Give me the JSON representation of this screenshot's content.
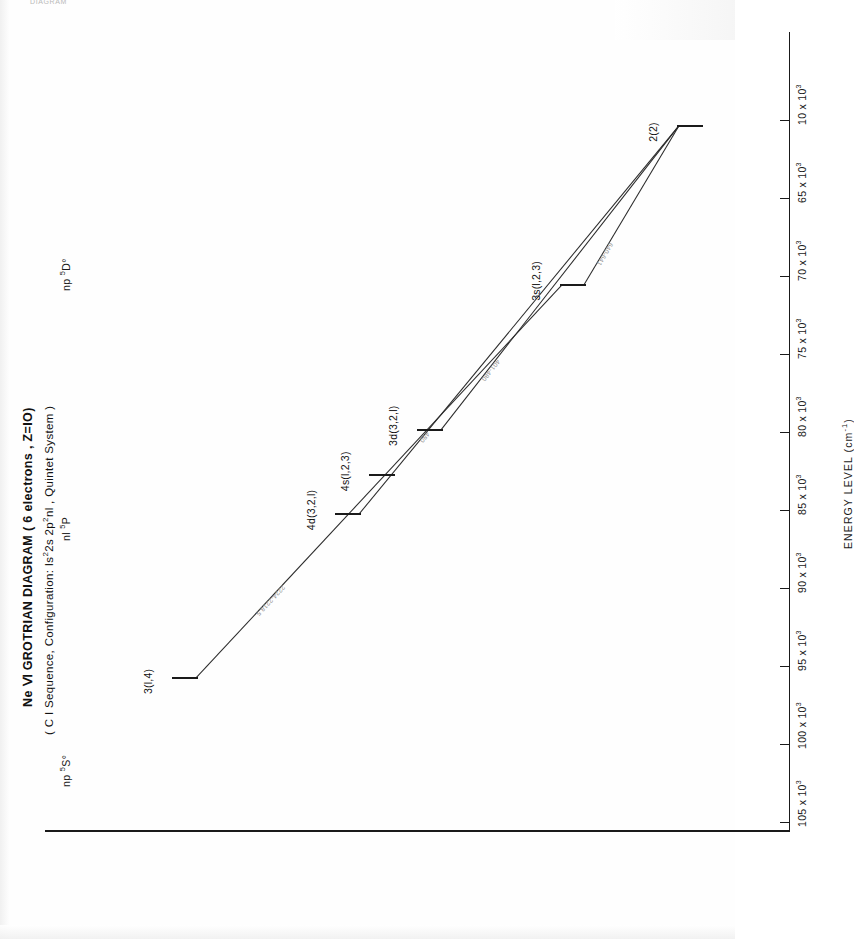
{
  "page": {
    "cropped_header": "DIAGRAM"
  },
  "figure": {
    "title": "Ne Ⅵ GROTRIAN DIAGRAM ( 6 electrons , Z=IO)",
    "subtitle_parts": {
      "prefix": "( C I  Sequence, Configuration:  Is",
      "sup1": "2",
      "mid": "2s  2p",
      "sup2": "2",
      "suffix": "nl , Quintet  System )"
    },
    "subtitle_plain": "( C I Sequence, Configuration: Is2 2s 2p2 nl , Quintet System )"
  },
  "axis": {
    "label": "ENERGY LEVEL (cm",
    "label_sup": "-1",
    "label_close": ")",
    "label_plain": "ENERGY LEVEL (cm-1)",
    "unit": "cm^-1",
    "ticks": [
      {
        "text": "105 x 10",
        "exp": "3",
        "value": 105000
      },
      {
        "text": "100 x 10",
        "exp": "3",
        "value": 100000
      },
      {
        "text": "95 x 10",
        "exp": "3",
        "value": 95000
      },
      {
        "text": "90 x 10",
        "exp": "3",
        "value": 90000
      },
      {
        "text": "85 x 10",
        "exp": "3",
        "value": 85000
      },
      {
        "text": "80 x 10",
        "exp": "3",
        "value": 80000
      },
      {
        "text": "75 x 10",
        "exp": "3",
        "value": 75000
      },
      {
        "text": "70 x 10",
        "exp": "3",
        "value": 70000
      },
      {
        "text": "65 x 10",
        "exp": "3",
        "value": 65000
      },
      {
        "text": "10 x 10",
        "exp": "3",
        "value": 60000
      }
    ]
  },
  "columns": [
    {
      "base": "np ",
      "sup": "5",
      "term": "S°",
      "plain": "np 5S°"
    },
    {
      "base": "nl ",
      "sup": "5",
      "term": "P",
      "plain": "nl 5P"
    },
    {
      "base": "np ",
      "sup": "5",
      "term": "D°",
      "plain": "np 5D°"
    }
  ],
  "levels": [
    {
      "id": "ground",
      "label": "2(2)",
      "column": "np 5S°"
    },
    {
      "id": "3s",
      "label": "3s(l,2,3)",
      "column": "nl 5P"
    },
    {
      "id": "3d",
      "label": "3d(3,2,l)",
      "column": "nl 5P"
    },
    {
      "id": "4s",
      "label": "4s(l,2,3)",
      "column": "nl 5P"
    },
    {
      "id": "4d",
      "label": "4d(3,2,l)",
      "column": "nl 5P"
    },
    {
      "id": "3p",
      "label": "3(l,4)",
      "column": "np 5D°"
    }
  ],
  "transitions": [
    {
      "from": "ground",
      "to": "3s",
      "wavelength": "640-641"
    },
    {
      "from": "ground",
      "to": "3d",
      "wavelength": "401-480"
    },
    {
      "from": "ground",
      "to": "4d",
      "wavelength": "480"
    },
    {
      "from": "3s",
      "to": "3p",
      "wavelength": "2224-2218.5"
    }
  ],
  "chart_data": {
    "type": "scatter",
    "title": "Ne Ⅵ GROTRIAN DIAGRAM ( 6 electrons , Z=IO)",
    "subtitle": "( C I Sequence, Configuration: Is2 2s 2p2 nl , Quintet System )",
    "xlabel": "",
    "ylabel": "ENERGY LEVEL (cm-1)",
    "ylim": [
      60000,
      107000
    ],
    "grid": false,
    "legend": "none",
    "x_categories": [
      "np 5S°",
      "nl 5P",
      "np 5D°"
    ],
    "levels": [
      {
        "name": "2(2)",
        "column": "np 5S°",
        "energy": 60300
      },
      {
        "name": "3s(l,2,3)",
        "column": "nl 5P",
        "energy": 70500
      },
      {
        "name": "3d(3,2,l)",
        "column": "nl 5P",
        "energy": 79800
      },
      {
        "name": "4s(l,2,3)",
        "column": "nl 5P",
        "energy": 82700
      },
      {
        "name": "4d(3,2,l)",
        "column": "nl 5P",
        "energy": 85200
      },
      {
        "name": "3(l,4)",
        "column": "np 5D°",
        "energy": 95700
      }
    ],
    "transitions": [
      {
        "lower": "2(2)",
        "upper": "3s(l,2,3)",
        "wavelength_A": "640-641"
      },
      {
        "lower": "2(2)",
        "upper": "3d(3,2,l)",
        "wavelength_A": "401-480"
      },
      {
        "lower": "2(2)",
        "upper": "4d(3,2,l)",
        "wavelength_A": "480"
      },
      {
        "lower": "3s(l,2,3)",
        "upper": "3(l,4)",
        "wavelength_A": "2224-2218.5"
      }
    ]
  }
}
